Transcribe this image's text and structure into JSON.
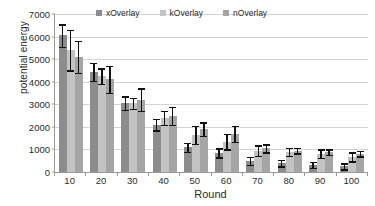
{
  "chart_data": {
    "type": "bar",
    "title": "",
    "xlabel": "Round",
    "ylabel": "potential energy",
    "categories": [
      "10",
      "20",
      "30",
      "40",
      "50",
      "60",
      "70",
      "80",
      "90",
      "100"
    ],
    "ylim": [
      0,
      7000
    ],
    "yticks": [
      0,
      1000,
      2000,
      3000,
      4000,
      5000,
      6000,
      7000
    ],
    "ytick_labels": [
      "0",
      "1000",
      "2000",
      "3000",
      "4000",
      "5000",
      "6000",
      "7000"
    ],
    "grid": true,
    "legend_position": "top-center",
    "series": [
      {
        "name": "xOverlay",
        "color": "#8c8c8c",
        "values": [
          6050,
          4450,
          3050,
          2100,
          1100,
          850,
          500,
          400,
          320,
          250
        ],
        "errors": [
          500,
          400,
          300,
          250,
          200,
          200,
          180,
          150,
          130,
          130
        ]
      },
      {
        "name": "kOverlay",
        "color": "#c3c3c3",
        "values": [
          5400,
          4250,
          3050,
          2400,
          1650,
          1350,
          950,
          900,
          820,
          680
        ],
        "errors": [
          900,
          350,
          250,
          300,
          400,
          350,
          230,
          180,
          180,
          200
        ]
      },
      {
        "name": "nOverlay",
        "color": "#a5a5a5",
        "values": [
          5100,
          4100,
          3200,
          2500,
          1900,
          1700,
          1050,
          950,
          880,
          820
        ],
        "errors": [
          700,
          600,
          500,
          400,
          300,
          350,
          170,
          130,
          120,
          120
        ]
      }
    ]
  }
}
